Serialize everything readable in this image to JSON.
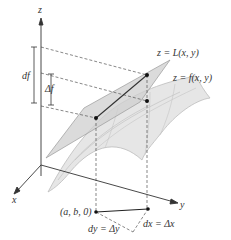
{
  "figure": {
    "colors": {
      "axis": "#333333",
      "dashed": "#555555",
      "plane_fill": "#c8c8c8",
      "surface_fill": "#e6e6e6",
      "surface_grid": "#b8b8b8",
      "point": "#111111",
      "background": "#ffffff"
    }
  },
  "axes": {
    "z_label": "z",
    "x_label": "x",
    "y_label": "y"
  },
  "labels": {
    "df": "df",
    "delta_f": "Δf",
    "tangent_plane": "z = L(x, y)",
    "surface": "z = f(x, y)",
    "base_point": "(a, b, 0)",
    "dy": "dy = Δy",
    "dx": "dx = Δx"
  }
}
